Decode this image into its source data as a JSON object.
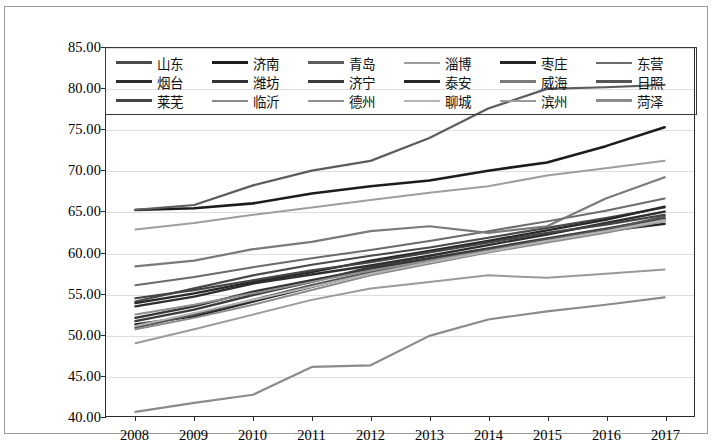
{
  "chart_data": {
    "type": "line",
    "title": "",
    "xlabel": "",
    "ylabel": "",
    "x": [
      "2008",
      "2009",
      "2010",
      "2011",
      "2012",
      "2013",
      "2014",
      "2015",
      "2016",
      "2017"
    ],
    "categories": [
      "2008",
      "2009",
      "2010",
      "2011",
      "2012",
      "2013",
      "2014",
      "2015",
      "2016",
      "2017"
    ],
    "ylim": [
      40,
      85
    ],
    "ytick_values": [
      40,
      45,
      50,
      55,
      60,
      65,
      70,
      75,
      80,
      85
    ],
    "ytick_labels": [
      "40.00",
      "45.00",
      "50.00",
      "55.00",
      "60.00",
      "65.00",
      "70.00",
      "75.00",
      "80.00",
      "85.00"
    ],
    "grid": true,
    "legend_position": "top-inside",
    "legend_columns": 6,
    "series": [
      {
        "name": "山东",
        "color": "#4a4a4a",
        "width": 2.2,
        "values": [
          54.0,
          55.6,
          57.2,
          58.5,
          59.6,
          60.6,
          61.8,
          63.0,
          64.2,
          65.5
        ]
      },
      {
        "name": "济南",
        "color": "#1c1c1c",
        "width": 2.6,
        "values": [
          65.2,
          65.4,
          66.0,
          67.2,
          68.1,
          68.8,
          70.0,
          71.0,
          73.0,
          75.3
        ]
      },
      {
        "name": "青岛",
        "color": "#5c5c5c",
        "width": 2.2,
        "values": [
          65.2,
          65.8,
          68.2,
          70.0,
          71.2,
          74.0,
          77.6,
          80.0,
          80.2,
          80.5
        ]
      },
      {
        "name": "淄博",
        "color": "#9e9e9e",
        "width": 2.0,
        "values": [
          62.8,
          63.6,
          64.6,
          65.5,
          66.4,
          67.3,
          68.1,
          69.4,
          70.3,
          71.2
        ]
      },
      {
        "name": "枣庄",
        "color": "#232323",
        "width": 2.4,
        "values": [
          51.2,
          52.2,
          54.0,
          55.8,
          57.5,
          59.0,
          60.4,
          61.6,
          62.6,
          63.5
        ]
      },
      {
        "name": "东营",
        "color": "#6b6b6b",
        "width": 2.0,
        "values": [
          56.0,
          57.0,
          58.2,
          59.3,
          60.3,
          61.4,
          62.6,
          63.8,
          65.1,
          66.6
        ]
      },
      {
        "name": "烟台",
        "color": "#2e2e2e",
        "width": 2.4,
        "values": [
          53.4,
          54.6,
          56.2,
          57.3,
          58.4,
          59.6,
          60.9,
          62.2,
          63.6,
          65.0
        ]
      },
      {
        "name": "潍坊",
        "color": "#333333",
        "width": 2.4,
        "values": [
          52.0,
          53.4,
          55.2,
          56.6,
          58.0,
          59.2,
          60.4,
          61.5,
          62.7,
          64.0
        ]
      },
      {
        "name": "济宁",
        "color": "#3b3b3b",
        "width": 2.4,
        "values": [
          51.6,
          53.0,
          54.8,
          56.4,
          58.2,
          59.3,
          60.5,
          61.7,
          62.9,
          64.2
        ]
      },
      {
        "name": "泰安",
        "color": "#282828",
        "width": 2.4,
        "values": [
          53.8,
          55.0,
          56.4,
          57.6,
          59.0,
          60.2,
          61.4,
          62.7,
          64.0,
          65.6
        ]
      },
      {
        "name": "威海",
        "color": "#7a7a7a",
        "width": 2.2,
        "values": [
          58.3,
          59.0,
          60.4,
          61.3,
          62.6,
          63.2,
          62.4,
          63.2,
          66.6,
          69.2
        ]
      },
      {
        "name": "日照",
        "color": "#555555",
        "width": 2.2,
        "values": [
          50.8,
          52.4,
          54.2,
          56.0,
          57.6,
          59.0,
          60.3,
          61.6,
          62.8,
          64.4
        ]
      },
      {
        "name": "莱芜",
        "color": "#444444",
        "width": 2.2,
        "values": [
          54.4,
          55.4,
          56.6,
          57.8,
          58.8,
          60.0,
          61.2,
          62.4,
          63.4,
          64.6
        ]
      },
      {
        "name": "临沂",
        "color": "#8a8a8a",
        "width": 2.0,
        "values": [
          50.6,
          52.0,
          53.6,
          55.4,
          57.2,
          58.6,
          60.0,
          61.2,
          62.4,
          63.8
        ]
      },
      {
        "name": "德州",
        "color": "#8f8f8f",
        "width": 2.0,
        "values": [
          52.4,
          53.6,
          55.0,
          56.4,
          57.8,
          59.0,
          60.2,
          61.4,
          62.6,
          64.0
        ]
      },
      {
        "name": "聊城",
        "color": "#b4b4b4",
        "width": 2.0,
        "values": [
          51.0,
          52.6,
          54.2,
          55.8,
          57.4,
          58.8,
          60.1,
          61.4,
          62.6,
          63.9
        ]
      },
      {
        "name": "滨州",
        "color": "#9a9a9a",
        "width": 2.0,
        "values": [
          48.9,
          50.6,
          52.4,
          54.2,
          55.6,
          56.4,
          57.2,
          56.9,
          57.4,
          57.9
        ]
      },
      {
        "name": "菏泽",
        "color": "#8b8b8b",
        "width": 2.2,
        "values": [
          40.5,
          41.6,
          42.6,
          46.0,
          46.2,
          49.8,
          51.8,
          52.8,
          53.6,
          54.5
        ]
      }
    ]
  },
  "legend": {
    "rows": [
      [
        "山东",
        "济南",
        "青岛",
        "淄博",
        "枣庄",
        "东营"
      ],
      [
        "烟台",
        "潍坊",
        "济宁",
        "泰安",
        "威海",
        "日照"
      ],
      [
        "莱芜",
        "临沂",
        "德州",
        "聊城",
        "滨州",
        "菏泽"
      ]
    ]
  }
}
